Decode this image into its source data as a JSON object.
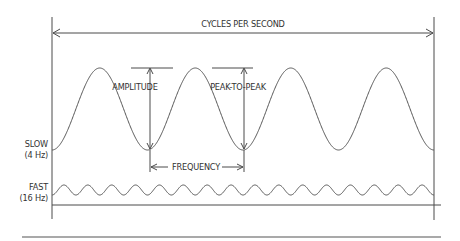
{
  "diagram": {
    "title_label": "CYCLES PER SECOND",
    "labels": {
      "amplitude": "AMPLITUDE",
      "peak_to_peak": "PEAK-TO-PEAK",
      "frequency": "FREQUENCY",
      "slow": "SLOW",
      "slow_hz": "(4 Hz)",
      "fast": "FAST",
      "fast_hz": "(16 Hz)"
    },
    "waves": [
      {
        "name": "slow",
        "frequency_hz": 4,
        "cycles_shown": 4
      },
      {
        "name": "fast",
        "frequency_hz": 16,
        "cycles_shown": 16
      }
    ],
    "colors": {
      "line": "#4a4a4a",
      "text": "#333333",
      "background": "#ffffff"
    }
  }
}
